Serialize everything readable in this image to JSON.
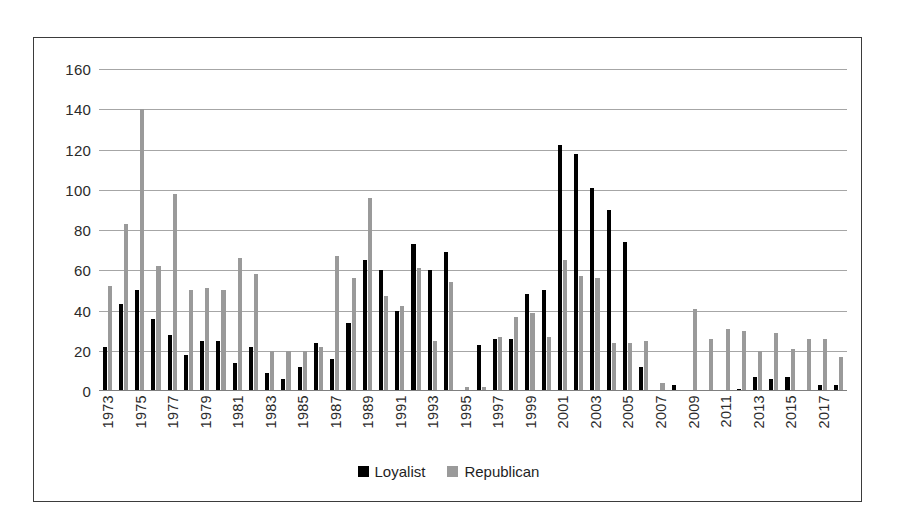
{
  "chart_data": {
    "type": "bar",
    "title": "",
    "subtitle": "",
    "xlabel": "",
    "ylabel": "",
    "ylim": [
      0,
      160
    ],
    "ytick_step": 20,
    "yticks": [
      0,
      20,
      40,
      60,
      80,
      100,
      120,
      140,
      160
    ],
    "grid": true,
    "legend_position": "bottom",
    "categories": [
      "1973",
      "1974",
      "1975",
      "1976",
      "1977",
      "1978",
      "1979",
      "1980",
      "1981",
      "1982",
      "1983",
      "1984",
      "1985",
      "1986",
      "1987",
      "1988",
      "1989",
      "1990",
      "1991",
      "1992",
      "1993",
      "1994",
      "1995",
      "1996",
      "1997",
      "1998",
      "1999",
      "2000",
      "2001",
      "2002",
      "2003",
      "2004",
      "2005",
      "2006",
      "2007",
      "2008",
      "2009",
      "2010",
      "2011",
      "2012",
      "2013",
      "2014",
      "2015",
      "2016",
      "2017",
      "2018"
    ],
    "tick_labels": [
      "1973",
      "1975",
      "1977",
      "1979",
      "1981",
      "1983",
      "1985",
      "1987",
      "1989",
      "1991",
      "1993",
      "1995",
      "1997",
      "1999",
      "2001",
      "2003",
      "2005",
      "2007",
      "2009",
      "2011",
      "2013",
      "2015",
      "2017"
    ],
    "series": [
      {
        "name": "Loyalist",
        "color": "#000000",
        "values": [
          22,
          43,
          50,
          36,
          28,
          18,
          25,
          25,
          14,
          22,
          9,
          6,
          12,
          24,
          16,
          34,
          65,
          60,
          40,
          73,
          60,
          69,
          0,
          23,
          26,
          26,
          48,
          50,
          122,
          118,
          101,
          90,
          74,
          12,
          0,
          3,
          0,
          0,
          0,
          1,
          7,
          6,
          7,
          0,
          3,
          3
        ]
      },
      {
        "name": "Republican",
        "color": "#9a9a9a",
        "values": [
          52,
          83,
          140,
          62,
          98,
          50,
          51,
          50,
          66,
          58,
          20,
          20,
          20,
          22,
          67,
          56,
          96,
          47,
          42,
          61,
          25,
          54,
          2,
          2,
          27,
          37,
          39,
          27,
          65,
          57,
          56,
          24,
          24,
          25,
          4,
          0,
          41,
          26,
          31,
          30,
          20,
          29,
          21,
          26,
          26,
          17
        ]
      }
    ],
    "legend": [
      {
        "label": "Loyalist",
        "color": "#000000",
        "key": "loyalist"
      },
      {
        "label": "Republican",
        "color": "#9a9a9a",
        "key": "republican"
      }
    ]
  },
  "style": {
    "frame_border_color": "#3b3b3b",
    "gridline_color": "#a6a6a6",
    "background": "#ffffff",
    "text_color": "#2b2b2b"
  }
}
